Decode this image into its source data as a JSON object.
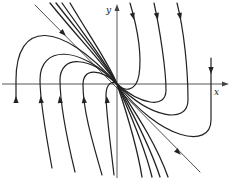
{
  "diagram": {
    "title": "",
    "type": "phase portrait (degenerate node)",
    "axes": {
      "x_label": "x",
      "y_label": "y",
      "origin": [
        117,
        84
      ]
    },
    "colors": {
      "stroke": "#222222",
      "background": "#ffffff"
    },
    "trajectories": [
      {
        "name": "separatrix-line",
        "d": "M 35 5 L 200 172",
        "width": 0.8,
        "arrows": [
          [
            63,
            33,
            45
          ],
          [
            178,
            152,
            45
          ]
        ]
      },
      {
        "name": "bundle-1",
        "d": "M 50 3 C 80 40, 105 65, 117 84 C 130 105, 155 140, 168 177",
        "width": 1.3,
        "arrows": []
      },
      {
        "name": "bundle-2",
        "d": "M 56 3 C 85 40, 107 65, 117 84 C 128 105, 148 140, 160 177",
        "width": 1.3,
        "arrows": []
      },
      {
        "name": "bundle-3",
        "d": "M 62 3 C 88 40, 108 65, 117 84 C 126 105, 143 140, 152 177",
        "width": 1.3,
        "arrows": []
      },
      {
        "name": "bundle-4",
        "d": "M 70 3 C 92 40, 110 65, 117 84 C 124 105, 136 140, 142 177",
        "width": 1.3,
        "arrows": []
      },
      {
        "name": "right-1",
        "d": "M 130 3 C 138 30, 142 55, 139 75 C 136 92, 124 92, 117 84",
        "width": 1.2,
        "arrows": [
          [
            133,
            16,
            75
          ]
        ]
      },
      {
        "name": "right-2",
        "d": "M 154 3 C 160 30, 166 70, 166 90 C 166 110, 140 104, 117 84",
        "width": 1.2,
        "arrows": [
          [
            157,
            16,
            78
          ]
        ]
      },
      {
        "name": "right-3",
        "d": "M 177 3 C 184 30, 188 70, 188 100 C 188 125, 150 118, 117 84",
        "width": 1.2,
        "arrows": [
          [
            180,
            16,
            78
          ]
        ]
      },
      {
        "name": "right-4",
        "d": "M 211 58 L 211 120 C 211 150, 160 140, 117 84",
        "width": 1.2,
        "arrows": [
          [
            211,
            70,
            90
          ]
        ]
      },
      {
        "name": "left-1",
        "d": "M 16 100 L 16 80 C 16 20, 60 20, 117 84",
        "width": 1.2,
        "arrows": [
          [
            16,
            100,
            -90
          ]
        ]
      },
      {
        "name": "left-2",
        "d": "M 52 168 C 45 130, 40 100, 40 80 C 40 45, 80 45, 117 84",
        "width": 1.2,
        "arrows": [
          [
            41,
            100,
            -95
          ]
        ]
      },
      {
        "name": "left-3",
        "d": "M 75 172 C 66 135, 60 100, 60 80 C 60 55, 90 55, 117 84",
        "width": 1.2,
        "arrows": [
          [
            60,
            100,
            -97
          ]
        ]
      },
      {
        "name": "left-4",
        "d": "M 102 175 C 92 140, 83 110, 83 85 C 83 68, 100 68, 117 84",
        "width": 1.2,
        "arrows": [
          [
            84,
            100,
            -97
          ]
        ]
      },
      {
        "name": "left-5",
        "d": "M 114 175 C 110 140, 106 112, 106 95 C 106 84, 112 80, 117 84",
        "width": 1.2,
        "arrows": [
          [
            107,
            100,
            -95
          ]
        ]
      }
    ]
  }
}
